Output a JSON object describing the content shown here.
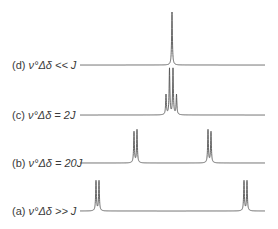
{
  "figure": {
    "line_color": "#555555",
    "spectra": [
      {
        "id": "d",
        "label_prefix": "(d)",
        "label_math": "ν°Δδ << J",
        "baseline_y": 65,
        "peaks": [
          {
            "x": 172,
            "h": 53
          }
        ]
      },
      {
        "id": "c",
        "label_prefix": "(c)",
        "label_math": "ν°Δδ = 2J",
        "baseline_y": 115,
        "peaks": [
          {
            "x": 166,
            "h": 20
          },
          {
            "x": 169.5,
            "h": 46
          },
          {
            "x": 173,
            "h": 46
          },
          {
            "x": 176.5,
            "h": 20
          }
        ]
      },
      {
        "id": "b",
        "label_prefix": "(b)",
        "label_math": "ν°Δδ = 20J",
        "baseline_y": 163,
        "peaks": [
          {
            "x": 134,
            "h": 31
          },
          {
            "x": 137,
            "h": 33
          },
          {
            "x": 208,
            "h": 33
          },
          {
            "x": 211,
            "h": 31
          }
        ]
      },
      {
        "id": "a",
        "label_prefix": "(a)",
        "label_math": "ν°Δδ >> J",
        "baseline_y": 211,
        "peaks": [
          {
            "x": 96,
            "h": 30
          },
          {
            "x": 99,
            "h": 30
          },
          {
            "x": 244,
            "h": 30
          },
          {
            "x": 247,
            "h": 30
          }
        ]
      }
    ],
    "x_start": 80,
    "x_end": 265
  }
}
